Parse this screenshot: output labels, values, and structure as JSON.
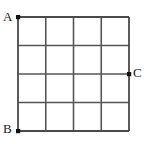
{
  "figure": {
    "type": "grid-diagram",
    "background_color": "#ffffff",
    "grid": {
      "columns": 4,
      "rows": 4,
      "cells": 16,
      "left": 18,
      "top": 17,
      "right": 129,
      "bottom": 131,
      "cell_width": 27.75,
      "cell_height": 28.5,
      "x_positions": [
        18,
        45.75,
        73.5,
        101.25,
        129
      ],
      "y_positions": [
        17,
        45.5,
        74,
        102.5,
        131
      ],
      "line_color": "#555555",
      "line_width": 1.6,
      "outer_line_color": "#4a4a4a",
      "outer_line_width": 1.8
    },
    "points": [
      {
        "id": "A",
        "label": "A",
        "x": 18,
        "y": 17,
        "position": "top-left-corner",
        "marker": "filled-square-dot",
        "marker_color": "#111111",
        "marker_size": 4,
        "label_color": "#1a1a1a"
      },
      {
        "id": "B",
        "label": "B",
        "x": 18,
        "y": 131,
        "position": "bottom-left-corner",
        "marker": "filled-square-dot",
        "marker_color": "#111111",
        "marker_size": 4,
        "label_color": "#1a1a1a"
      },
      {
        "id": "C",
        "label": "C",
        "x": 129,
        "y": 74,
        "position": "right-edge-midpoint",
        "marker": "filled-square-dot",
        "marker_color": "#111111",
        "marker_size": 4,
        "label_color": "#1a1a1a"
      }
    ]
  }
}
